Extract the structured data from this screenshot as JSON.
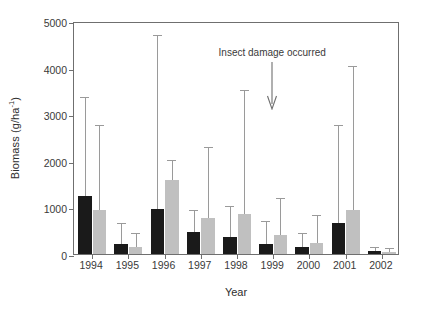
{
  "chart_data": {
    "type": "bar",
    "title": "",
    "xlabel": "Year",
    "ylabel": "Biomass (g/ha-1)",
    "ylabel_html": "Biomass (g/ha<sup>-1</sup>)",
    "categories": [
      "1994",
      "1995",
      "1996",
      "1997",
      "1998",
      "1999",
      "2000",
      "2001",
      "2002"
    ],
    "ylim": [
      0,
      5000
    ],
    "yticks": [
      0,
      1000,
      2000,
      3000,
      4000,
      5000
    ],
    "ytick_labels": [
      "0",
      "1000",
      "2000",
      "3000",
      "4000",
      "5000"
    ],
    "grid": false,
    "legend": "none",
    "series": [
      {
        "name": "series-black",
        "color": "#1a1a1a",
        "values": [
          1250,
          220,
          960,
          470,
          360,
          210,
          140,
          670,
          60
        ],
        "error_upper": [
          3350,
          640,
          4680,
          930,
          1000,
          690,
          420,
          2750,
          130
        ]
      },
      {
        "name": "series-gray",
        "color": "#c0c0c0",
        "values": [
          950,
          150,
          1580,
          780,
          860,
          400,
          230,
          950,
          50
        ],
        "error_upper": [
          2740,
          430,
          2000,
          2280,
          3500,
          1180,
          820,
          4020,
          110
        ]
      }
    ],
    "annotations": [
      {
        "name": "insect-damage",
        "text": "Insect damage occurred",
        "points_to_category": "1999",
        "arrow": "down"
      }
    ]
  },
  "axis": {
    "y_title_main": "Biomass (g/ha",
    "y_title_sup": "-1",
    "y_title_close": ")"
  }
}
